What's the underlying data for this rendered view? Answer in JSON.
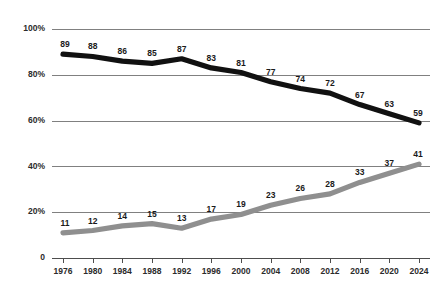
{
  "chart_data": {
    "type": "line",
    "title": "",
    "subtitle": "",
    "xlabel": "",
    "ylabel": "",
    "categories": [
      "1976",
      "1980",
      "1984",
      "1988",
      "1992",
      "1996",
      "2000",
      "2004",
      "2008",
      "2012",
      "2016",
      "2020",
      "2024"
    ],
    "x": [
      1976,
      1980,
      1984,
      1988,
      1992,
      1996,
      2000,
      2004,
      2008,
      2012,
      2016,
      2020,
      2024
    ],
    "series": [
      {
        "name": "black-line",
        "color": "#111111",
        "values": [
          89,
          88,
          86,
          85,
          87,
          83,
          81,
          77,
          74,
          72,
          67,
          63,
          59
        ]
      },
      {
        "name": "gray-line",
        "color": "#8f8f8f",
        "values": [
          11,
          12,
          14,
          15,
          13,
          17,
          19,
          23,
          26,
          28,
          33,
          37,
          41
        ]
      }
    ],
    "ylim": [
      0,
      100
    ],
    "ytick_values": [
      0,
      20,
      40,
      60,
      80,
      100
    ],
    "ytick_labels": [
      "0",
      "20%",
      "40%",
      "60%",
      "80%",
      "100%"
    ],
    "grid": true,
    "grid_axis": "y",
    "legend": false,
    "legend_position": "none",
    "data_labels": true,
    "annotations": []
  },
  "colors": {
    "background": "#ffffff",
    "gridline": "#808080",
    "axis": "#4d4d4d",
    "primary_series": "#111111",
    "secondary_series": "#8f8f8f",
    "label_text": "#1a1a1a"
  }
}
